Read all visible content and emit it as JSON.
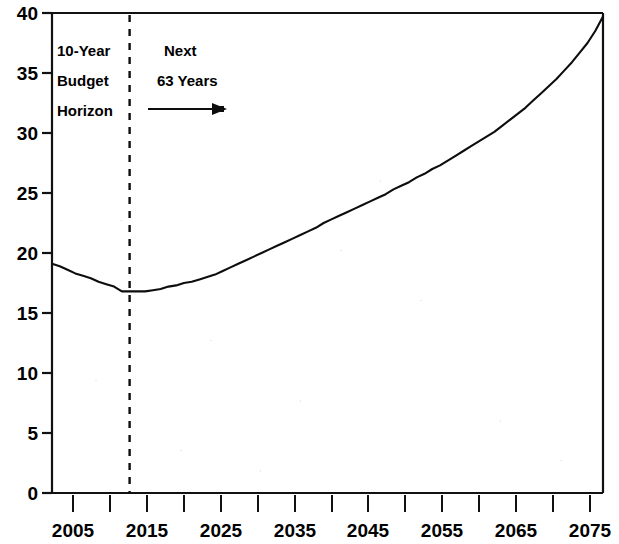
{
  "chart_data": {
    "type": "line",
    "title": "",
    "subtitle": "",
    "xlabel": "",
    "ylabel": "",
    "xlim": [
      2004,
      2075
    ],
    "ylim": [
      0,
      40
    ],
    "grid": false,
    "legend": "none",
    "y_ticks": [
      0,
      5,
      10,
      15,
      20,
      25,
      30,
      35,
      40
    ],
    "y_tick_labels": [
      "0",
      "5",
      "10",
      "15",
      "20",
      "25",
      "30",
      "35",
      "40"
    ],
    "x_ticks": [
      2005,
      2010,
      2015,
      2020,
      2025,
      2030,
      2035,
      2040,
      2045,
      2050,
      2055,
      2060,
      2065,
      2070,
      2075
    ],
    "x_tick_labels": [
      "2005",
      "",
      "2015",
      "",
      "2025",
      "",
      "2035",
      "",
      "2045",
      "",
      "2055",
      "",
      "2065",
      "",
      "2075"
    ],
    "x_major_labels": [
      "2005",
      "2015",
      "2025",
      "2035",
      "2045",
      "2055",
      "2065",
      "2075"
    ],
    "series": [
      {
        "name": "Projected spending as percent of GDP",
        "color": "#0d0d0d",
        "x": [
          2004,
          2005,
          2006,
          2007,
          2008,
          2009,
          2010,
          2011,
          2012,
          2013,
          2014,
          2015,
          2016,
          2017,
          2018,
          2019,
          2020,
          2021,
          2022,
          2023,
          2024,
          2025,
          2026,
          2027,
          2028,
          2029,
          2030,
          2031,
          2032,
          2033,
          2034,
          2035,
          2036,
          2037,
          2038,
          2039,
          2040,
          2041,
          2042,
          2043,
          2044,
          2045,
          2046,
          2047,
          2048,
          2049,
          2050,
          2051,
          2052,
          2053,
          2054,
          2055,
          2056,
          2057,
          2058,
          2059,
          2060,
          2061,
          2062,
          2063,
          2064,
          2065,
          2066,
          2067,
          2068,
          2069,
          2070,
          2071,
          2072,
          2073,
          2074,
          2075
        ],
        "y": [
          19.1,
          18.9,
          18.6,
          18.3,
          18.1,
          17.9,
          17.6,
          17.4,
          17.2,
          16.8,
          16.8,
          16.8,
          16.8,
          16.9,
          17.0,
          17.2,
          17.3,
          17.5,
          17.6,
          17.8,
          18.0,
          18.2,
          18.5,
          18.8,
          19.1,
          19.4,
          19.7,
          20.0,
          20.3,
          20.6,
          20.9,
          21.2,
          21.5,
          21.8,
          22.1,
          22.5,
          22.8,
          23.1,
          23.4,
          23.7,
          24.0,
          24.3,
          24.6,
          24.9,
          25.3,
          25.6,
          25.9,
          26.3,
          26.6,
          27.0,
          27.3,
          27.7,
          28.1,
          28.5,
          28.9,
          29.3,
          29.7,
          30.1,
          30.6,
          31.1,
          31.6,
          32.1,
          32.7,
          33.3,
          33.9,
          34.5,
          35.2,
          35.9,
          36.7,
          37.5,
          38.5,
          39.7
        ]
      }
    ],
    "annotations": [
      {
        "name": "budget-horizon-label",
        "lines": [
          "10-Year",
          "Budget",
          "Horizon"
        ],
        "at_x": 2005,
        "at_y": 37
      },
      {
        "name": "next-years-label",
        "lines": [
          "Next",
          "63 Years"
        ],
        "at_x": 2016,
        "at_y": 37
      },
      {
        "name": "horizon-divider",
        "type": "vertical-dashed-line",
        "at_x": 2014
      },
      {
        "name": "next-years-arrow",
        "type": "right-arrow",
        "from_x": 2015,
        "to_x": 2023,
        "at_y": 31.5
      }
    ]
  },
  "labels": {
    "y": {
      "t40": "40",
      "t35": "35",
      "t30": "30",
      "t25": "25",
      "t20": "20",
      "t15": "15",
      "t10": "10",
      "t5": "5",
      "t0": "0"
    },
    "x": {
      "t2005": "2005",
      "t2015": "2015",
      "t2025": "2025",
      "t2035": "2035",
      "t2045": "2045",
      "t2055": "2055",
      "t2065": "2065",
      "t2075": "2075"
    },
    "annotation": {
      "horizon_line1": "10-Year",
      "horizon_line2": "Budget",
      "horizon_line3": "Horizon",
      "next_line1": "Next",
      "next_line2": "63 Years"
    }
  },
  "colors": {
    "line": "#0d0d0d",
    "axis": "#111111",
    "background": "#ffffff",
    "text": "#000000"
  }
}
